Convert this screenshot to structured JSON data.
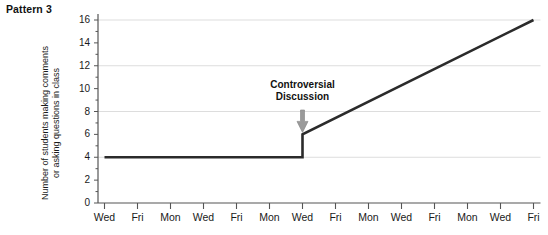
{
  "title": "Pattern 3",
  "chart_data": {
    "type": "line",
    "title": "Pattern 3",
    "xlabel": "",
    "ylabel": "Number of students making comments\nor asking questions in class",
    "ylim": [
      0,
      16
    ],
    "ytick_values": [
      0,
      2,
      4,
      6,
      8,
      10,
      12,
      14,
      16
    ],
    "ytick_labels": [
      "0",
      "2",
      "4",
      "6",
      "8",
      "10",
      "12",
      "14",
      "16"
    ],
    "gridlines_y": [
      4,
      8,
      12,
      16
    ],
    "grid": true,
    "legend": "none",
    "categories": [
      "Wed",
      "Fri",
      "Mon",
      "Wed",
      "Fri",
      "Mon",
      "Wed",
      "Fri",
      "Mon",
      "Wed",
      "Fri",
      "Mon",
      "Wed",
      "Fri"
    ],
    "x_indices": [
      0,
      1,
      2,
      3,
      4,
      5,
      6,
      7,
      8,
      9,
      10,
      11,
      12,
      13
    ],
    "series": [
      {
        "name": "Number of students making comments or asking questions in class",
        "color": "#2b2b2b",
        "values": [
          4,
          4,
          4,
          4,
          4,
          4,
          4,
          6,
          7.43,
          8.86,
          10.29,
          11.71,
          13.14,
          16
        ],
        "step_at_index": 6,
        "step_from": 4,
        "step_to": 6,
        "segments": [
          {
            "kind": "flat",
            "from_index": 0,
            "to_index": 6,
            "value": 4
          },
          {
            "kind": "vertical",
            "at_index": 6,
            "from_value": 4,
            "to_value": 6
          },
          {
            "kind": "rising",
            "from_index": 6,
            "to_index": 13,
            "from_value": 6,
            "to_value": 16
          }
        ]
      }
    ],
    "annotations": [
      {
        "text": "Controversial\nDiscussion",
        "at_category": "Wed",
        "at_index": 6,
        "arrow": "down",
        "arrow_color": "#9a9a9a"
      }
    ],
    "colors": {
      "line": "#2b2b2b",
      "axis": "#555555",
      "grid": "#dddddd",
      "arrow": "#9a9a9a",
      "text": "#1a1a1a"
    }
  },
  "y_ticks": [
    {
      "label": "16"
    },
    {
      "label": "14"
    },
    {
      "label": "12"
    },
    {
      "label": "10"
    },
    {
      "label": "8"
    },
    {
      "label": "6"
    },
    {
      "label": "4"
    },
    {
      "label": "2"
    },
    {
      "label": "0"
    }
  ],
  "x_ticks": [
    {
      "label": "Wed"
    },
    {
      "label": "Fri"
    },
    {
      "label": "Mon"
    },
    {
      "label": "Wed"
    },
    {
      "label": "Fri"
    },
    {
      "label": "Mon"
    },
    {
      "label": "Wed"
    },
    {
      "label": "Fri"
    },
    {
      "label": "Mon"
    },
    {
      "label": "Wed"
    },
    {
      "label": "Fri"
    },
    {
      "label": "Mon"
    },
    {
      "label": "Wed"
    },
    {
      "label": "Fri"
    }
  ],
  "y_axis_title": "Number of students making comments\nor asking questions in class",
  "annotation": {
    "text": "Controversial\nDiscussion"
  }
}
